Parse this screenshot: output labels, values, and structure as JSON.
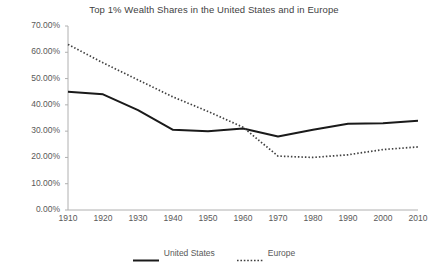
{
  "chart_data": {
    "type": "line",
    "title": "Top 1% Wealth Shares in the United States and in Europe",
    "xlabel": "",
    "ylabel": "",
    "x": [
      1910,
      1920,
      1930,
      1940,
      1950,
      1960,
      1970,
      1980,
      1990,
      2000,
      2010
    ],
    "xticklabels": [
      "1910",
      "1920",
      "1930",
      "1940",
      "1950",
      "1960",
      "1970",
      "1980",
      "1990",
      "2000",
      "2010"
    ],
    "yticklabels": [
      "0.00%",
      "10.00%",
      "20.00%",
      "30.00%",
      "40.00%",
      "50.00%",
      "60.00%",
      "70.00%"
    ],
    "ytickvalues": [
      0,
      10,
      20,
      30,
      40,
      50,
      60,
      70
    ],
    "ylim": [
      0,
      70
    ],
    "xlim": [
      1910,
      2010
    ],
    "grid": false,
    "legend_position": "bottom",
    "series": [
      {
        "name": "United States",
        "style": "solid",
        "color": "#1a1a1a",
        "values": [
          45.0,
          44.0,
          38.0,
          30.5,
          30.0,
          31.0,
          28.0,
          30.5,
          32.8,
          33.0,
          34.0
        ]
      },
      {
        "name": "Europe",
        "style": "dotted",
        "color": "#404040",
        "values": [
          63.0,
          56.0,
          49.5,
          43.0,
          37.5,
          31.5,
          20.5,
          20.0,
          21.0,
          23.0,
          24.0
        ]
      }
    ]
  },
  "legend": {
    "entries": [
      {
        "label": "United States"
      },
      {
        "label": "Europe"
      }
    ]
  }
}
